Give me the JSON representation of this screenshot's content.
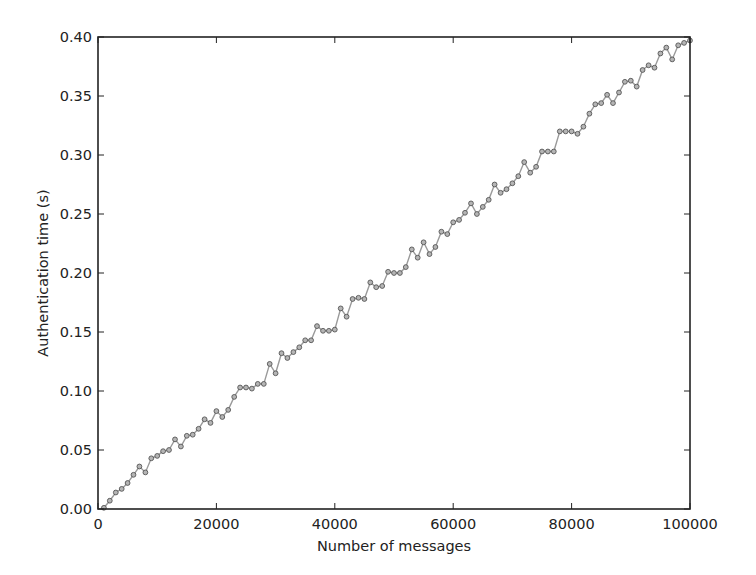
{
  "chart_data": {
    "type": "line",
    "title": "",
    "xlabel": "Number of messages",
    "ylabel": "Authentication time (s)",
    "xlim": [
      0,
      100000
    ],
    "ylim": [
      0.0,
      0.4
    ],
    "grid": false,
    "legend": null,
    "x_ticks": [
      0,
      20000,
      40000,
      60000,
      80000,
      100000
    ],
    "x_tick_labels": [
      "0",
      "20000",
      "40000",
      "60000",
      "80000",
      "100000"
    ],
    "y_ticks": [
      0.0,
      0.05,
      0.1,
      0.15,
      0.2,
      0.25,
      0.3,
      0.35,
      0.4
    ],
    "y_tick_labels": [
      "0.00",
      "0.05",
      "0.10",
      "0.15",
      "0.20",
      "0.25",
      "0.30",
      "0.35",
      "0.40"
    ],
    "series": [
      {
        "name": "Authentication time",
        "color": "#888888",
        "marker": "circle",
        "x": [
          1000,
          2000,
          3000,
          4000,
          5000,
          6000,
          7000,
          8000,
          9000,
          10000,
          11000,
          12000,
          13000,
          14000,
          15000,
          16000,
          17000,
          18000,
          19000,
          20000,
          21000,
          22000,
          23000,
          24000,
          25000,
          26000,
          27000,
          28000,
          29000,
          30000,
          31000,
          32000,
          33000,
          34000,
          35000,
          36000,
          37000,
          38000,
          39000,
          40000,
          41000,
          42000,
          43000,
          44000,
          45000,
          46000,
          47000,
          48000,
          49000,
          50000,
          51000,
          52000,
          53000,
          54000,
          55000,
          56000,
          57000,
          58000,
          59000,
          60000,
          61000,
          62000,
          63000,
          64000,
          65000,
          66000,
          67000,
          68000,
          69000,
          70000,
          71000,
          72000,
          73000,
          74000,
          75000,
          76000,
          77000,
          78000,
          79000,
          80000,
          81000,
          82000,
          83000,
          84000,
          85000,
          86000,
          87000,
          88000,
          89000,
          90000,
          91000,
          92000,
          93000,
          94000,
          95000,
          96000,
          97000,
          98000,
          99000,
          100000
        ],
        "values": [
          0.001,
          0.007,
          0.014,
          0.017,
          0.022,
          0.029,
          0.036,
          0.031,
          0.043,
          0.045,
          0.049,
          0.05,
          0.059,
          0.053,
          0.062,
          0.063,
          0.068,
          0.076,
          0.073,
          0.083,
          0.078,
          0.084,
          0.095,
          0.103,
          0.103,
          0.102,
          0.106,
          0.106,
          0.123,
          0.115,
          0.132,
          0.128,
          0.133,
          0.137,
          0.143,
          0.143,
          0.155,
          0.151,
          0.151,
          0.152,
          0.17,
          0.163,
          0.178,
          0.179,
          0.178,
          0.192,
          0.188,
          0.189,
          0.201,
          0.2,
          0.2,
          0.205,
          0.22,
          0.213,
          0.226,
          0.216,
          0.222,
          0.235,
          0.233,
          0.243,
          0.245,
          0.251,
          0.259,
          0.25,
          0.256,
          0.262,
          0.275,
          0.268,
          0.271,
          0.276,
          0.282,
          0.294,
          0.285,
          0.29,
          0.303,
          0.303,
          0.303,
          0.32,
          0.32,
          0.32,
          0.318,
          0.324,
          0.335,
          0.343,
          0.344,
          0.351,
          0.344,
          0.353,
          0.362,
          0.363,
          0.358,
          0.372,
          0.376,
          0.374,
          0.386,
          0.391,
          0.381,
          0.393,
          0.395,
          0.397
        ]
      }
    ]
  }
}
